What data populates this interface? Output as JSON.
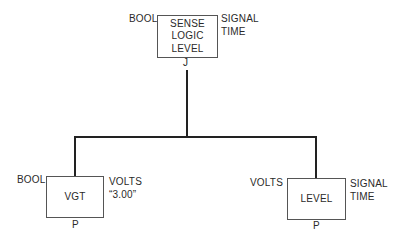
{
  "diagram": {
    "root": {
      "label": "SENSE\nLOGIC\nLEVEL",
      "left_label": "BOOL",
      "right_label": "SIGNAL\nTIME",
      "bottom_label": "J"
    },
    "children": [
      {
        "label": "VGT",
        "left_label": "BOOL",
        "right_label": "VOLTS\n“3.00”",
        "bottom_label": "P"
      },
      {
        "label": "LEVEL",
        "left_label": "VOLTS",
        "right_label": "SIGNAL\nTIME",
        "bottom_label": "P"
      }
    ],
    "colors": {
      "line": "#222222",
      "box_border": "#555555",
      "text": "#2a2a2a"
    }
  }
}
